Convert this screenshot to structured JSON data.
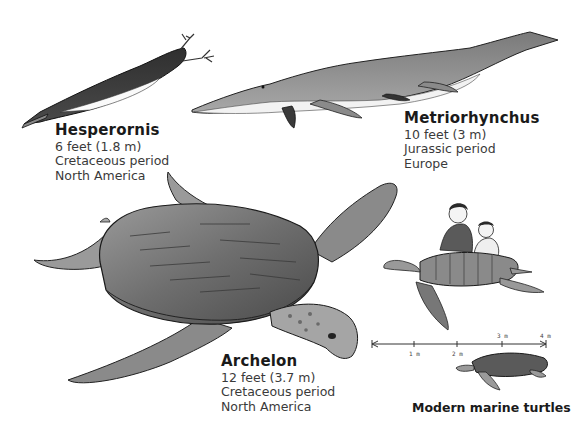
{
  "creatures": {
    "hesperornis": {
      "name": "Hesperornis",
      "size": "6 feet (1.8 m)",
      "period": "Cretaceous period",
      "region": "North America"
    },
    "metriorhynchus": {
      "name": "Metriorhynchus",
      "size": "10 feet (3 m)",
      "period": "Jurassic period",
      "region": "Europe"
    },
    "archelon": {
      "name": "Archelon",
      "size": "12 feet (3.7 m)",
      "period": "Cretaceous period",
      "region": "North America"
    }
  },
  "scale_bar": {
    "ticks": [
      "1 m",
      "2 m",
      "3 m",
      "4 m"
    ]
  },
  "modern": {
    "caption": "Modern marine turtles"
  },
  "colors": {
    "ink": "#1a1a1a",
    "shell_dark": "#5a5a5a",
    "shell_mid": "#8a8a8a",
    "skin_light": "#b5b5b5",
    "background": "#ffffff"
  }
}
